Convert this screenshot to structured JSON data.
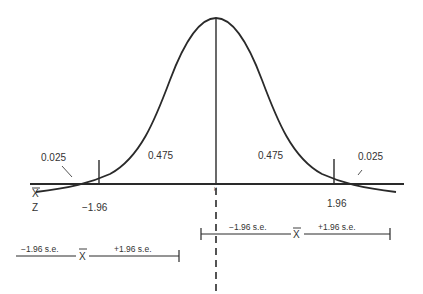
{
  "diagram": {
    "type": "normal-distribution-confidence-interval",
    "areas": {
      "left_tail": "0.025",
      "left_center": "0.475",
      "right_center": "0.475",
      "right_tail": "0.025"
    },
    "axis_labels": {
      "xbar": "X",
      "z": "Z",
      "mu": "μ"
    },
    "z_values": {
      "lower": "−1.96",
      "upper": "1.96"
    },
    "interval_upper": {
      "minus_label": "−1.96 s.e.",
      "center": "X",
      "plus_label": "+1.96 s.e."
    },
    "interval_lower": {
      "minus_label": "−1.96 s.e.",
      "center": "X",
      "plus_label": "+1.96 s.e."
    },
    "colors": {
      "ink": "#2a2a2a",
      "background": "#ffffff"
    }
  }
}
